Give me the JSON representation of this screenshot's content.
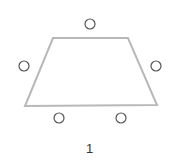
{
  "diagram": {
    "label": "1",
    "colors": {
      "table_stroke": "#b8b8b8",
      "seat_stroke": "#555555",
      "seat_fill": "#ffffff",
      "label": "#333333"
    },
    "table": {
      "shape": "trapezoid",
      "points": [
        [
          53,
          38
        ],
        [
          128,
          38
        ],
        [
          157,
          105
        ],
        [
          25,
          106
        ]
      ]
    },
    "seats": [
      {
        "id": "top",
        "cx": 90,
        "cy": 24,
        "r": 5
      },
      {
        "id": "left",
        "cx": 24,
        "cy": 66,
        "r": 5
      },
      {
        "id": "right",
        "cx": 156,
        "cy": 66,
        "r": 5
      },
      {
        "id": "bottom-left",
        "cx": 59,
        "cy": 118,
        "r": 5
      },
      {
        "id": "bottom-right",
        "cx": 121,
        "cy": 118,
        "r": 5
      }
    ]
  }
}
